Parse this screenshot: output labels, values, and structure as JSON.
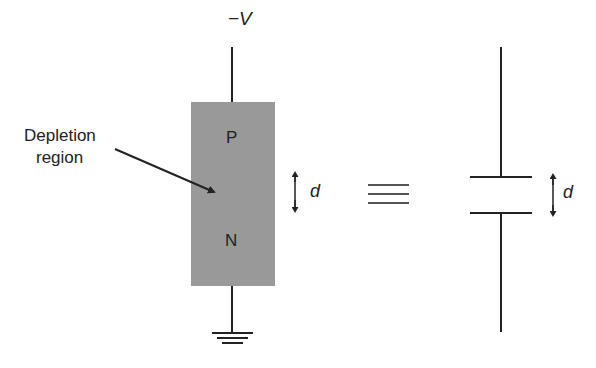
{
  "labels": {
    "voltage": "−V",
    "depletion": "Depletion",
    "region": "region",
    "p_type": "P",
    "n_type": "N",
    "distance_left": "d",
    "distance_right": "d"
  },
  "colors": {
    "diode_fill": "#999999",
    "line": "#222222"
  },
  "symbols": {
    "equivalent": "equivalent-to (triple bar)",
    "ground": "ground-icon",
    "capacitor": "capacitor-icon"
  }
}
